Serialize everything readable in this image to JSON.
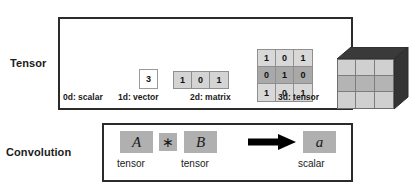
{
  "rows": {
    "tensor_label": "Tensor",
    "convolution_label": "Convolution"
  },
  "tensor": {
    "items": [
      {
        "caption": "0d: scalar",
        "kind": "scalar",
        "value": "3"
      },
      {
        "caption": "1d: vector",
        "kind": "vector",
        "values": [
          "1",
          "0",
          "1"
        ]
      },
      {
        "caption": "2d: matrix",
        "kind": "matrix",
        "rows": [
          [
            "1",
            "0",
            "1"
          ],
          [
            "0",
            "1",
            "0"
          ],
          [
            "1",
            "0",
            "1"
          ]
        ]
      },
      {
        "caption": "3d: tensor",
        "kind": "cube"
      }
    ]
  },
  "convolution": {
    "operand_a": "A",
    "operator": "∗",
    "operand_b": "B",
    "result": "a",
    "caption_a": "tensor",
    "caption_b": "tensor",
    "caption_result": "scalar",
    "arrow": "arrow-right-icon"
  },
  "colors": {
    "panel_border": "#2b2b2b",
    "cell_light": "#d8d8d8",
    "cell_dark": "#a9a9a9",
    "tile_gray": "#b0b0b0",
    "cube_dark": "#3a3a3a",
    "text": "#1a1a1a"
  }
}
